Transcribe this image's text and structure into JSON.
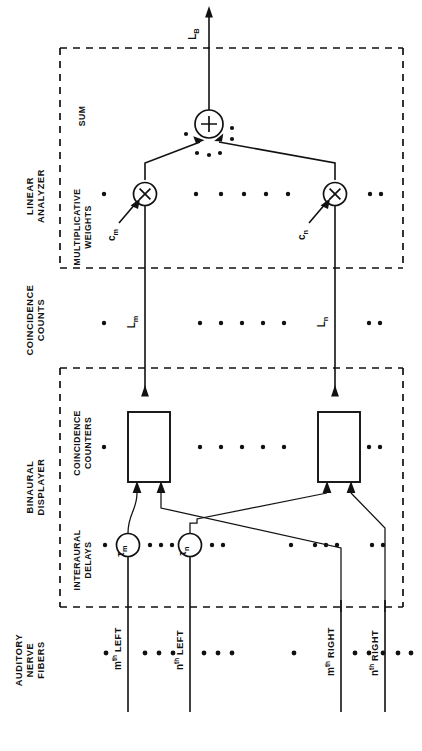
{
  "figure": {
    "orientation": "rotated-90-ccw",
    "output_label": "L",
    "output_label_sub": "B"
  },
  "stages": [
    {
      "id": "auditory-nerve-fibers",
      "lines": [
        "AUDITORY",
        "NERVE",
        "FIBERS"
      ]
    },
    {
      "id": "binaural-displayer",
      "lines": [
        "BINAURAL",
        "DISPLAYER"
      ]
    },
    {
      "id": "coincidence-counts",
      "lines": [
        "COINCIDENCE",
        "COUNTS"
      ]
    },
    {
      "id": "linear-analyzer",
      "lines": [
        "LINEAR",
        "ANALYZER"
      ]
    }
  ],
  "substages": [
    {
      "id": "interaural-delays",
      "lines": [
        "INTERAURAL",
        "DELAYS"
      ]
    },
    {
      "id": "coincidence-counters",
      "lines": [
        "COINCIDENCE",
        "COUNTERS"
      ]
    },
    {
      "id": "multiplicative-weights",
      "lines": [
        "MULTIPLICATIVE",
        "WEIGHTS"
      ]
    },
    {
      "id": "sum",
      "lines": [
        "SUM"
      ]
    }
  ],
  "fiber_labels": [
    {
      "id": "m-left",
      "index": "m",
      "sup": "th",
      "side": "LEFT"
    },
    {
      "id": "n-left",
      "index": "n",
      "sup": "th",
      "side": "LEFT"
    },
    {
      "id": "m-right",
      "index": "m",
      "sup": "th",
      "side": "RIGHT"
    },
    {
      "id": "n-right",
      "index": "n",
      "sup": "th",
      "side": "RIGHT"
    }
  ],
  "delay_elements": [
    {
      "id": "tau-m",
      "symbol": "τ",
      "sub": "m"
    },
    {
      "id": "tau-n",
      "symbol": "τ",
      "sub": "n"
    }
  ],
  "count_labels": [
    {
      "id": "L-m",
      "symbol": "L",
      "sub": "m"
    },
    {
      "id": "L-n",
      "symbol": "L",
      "sub": "n"
    }
  ],
  "weight_labels": [
    {
      "id": "c-m",
      "symbol": "c",
      "sub": "m"
    },
    {
      "id": "c-n",
      "symbol": "c",
      "sub": "n"
    }
  ],
  "operators": [
    {
      "id": "multiplier-m",
      "glyph": "×"
    },
    {
      "id": "multiplier-n",
      "glyph": "×"
    },
    {
      "id": "summer",
      "glyph": "+"
    }
  ],
  "colors": {
    "ink": "#111111",
    "background": "#ffffff"
  }
}
